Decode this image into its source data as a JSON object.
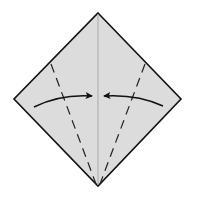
{
  "diagram": {
    "title": "Kite base fold: fold both lower edges to the center crease",
    "type": "origami-step",
    "colors": {
      "background": "#ffffff",
      "paper_fill": "#dcdcdc",
      "paper_outline": "#111111",
      "center_crease": "#a8a8a8",
      "fold_lines": "#222222",
      "arrows": "#111111"
    },
    "paper": {
      "shape": "diamond",
      "vertices": {
        "top": [
          98,
          13
        ],
        "right": [
          181,
          99
        ],
        "bottom": [
          98,
          186
        ],
        "left": [
          14,
          99
        ]
      }
    },
    "center_crease": {
      "from": [
        98,
        14
      ],
      "to": [
        98,
        185
      ]
    },
    "valley_folds": [
      {
        "name": "left-valley-fold",
        "from": [
          51,
          64
        ],
        "to": [
          96,
          184
        ]
      },
      {
        "name": "right-valley-fold",
        "from": [
          145,
          64
        ],
        "to": [
          100,
          184
        ]
      }
    ],
    "arrows": [
      {
        "name": "left-fold-arrow",
        "direction": "right",
        "tail": [
          34,
          107
        ],
        "control": [
          60,
          94
        ],
        "head": [
          92,
          96
        ]
      },
      {
        "name": "right-fold-arrow",
        "direction": "left",
        "tail": [
          163,
          106
        ],
        "control": [
          137,
          94
        ],
        "head": [
          104,
          96
        ]
      }
    ]
  }
}
